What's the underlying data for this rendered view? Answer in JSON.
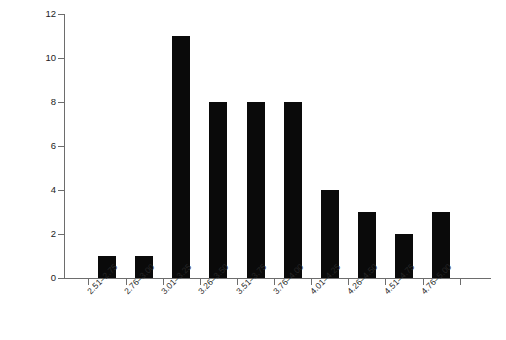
{
  "chart_data": {
    "type": "bar",
    "title": "",
    "subtitle": "",
    "xlabel": "",
    "ylabel": "Frequency",
    "categories": [
      "2.51–2.75",
      "2.76–3.00",
      "3.01–3.25",
      "3.26–3.50",
      "3.51–3.75",
      "3.76–4.00",
      "4.01–4.25",
      "4.26–4.50",
      "4.51–4.75",
      "4.76–5.00"
    ],
    "values": [
      1,
      1,
      11,
      8,
      8,
      8,
      4,
      3,
      2,
      3
    ],
    "ylim": [
      0,
      12
    ],
    "ytick_labels": [
      "0",
      "2",
      "4",
      "6",
      "8",
      "10",
      "12"
    ],
    "ytick_values": [
      0,
      2,
      4,
      6,
      8,
      10,
      12
    ],
    "grid": false,
    "legend": false,
    "legend_position": "none",
    "bar_color": "#0a0a0a",
    "axis_color": "#6d6d6d",
    "background_color": "#ffffff"
  }
}
